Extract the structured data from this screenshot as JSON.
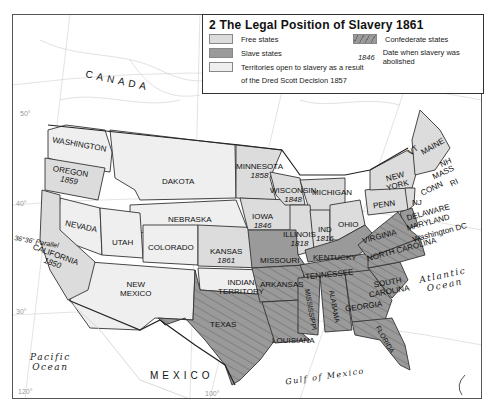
{
  "legend": {
    "title": "2 The Legal Position of Slavery 1861",
    "items": [
      {
        "label": "Free states",
        "color": "#dcdcdc"
      },
      {
        "label": "Slave states",
        "color": "#9a9a9a"
      },
      {
        "label": "Territories open to slavery as a result",
        "label2": "of the Dred Scott Decision 1857",
        "color": "#efefef"
      },
      {
        "label": "Confederate states",
        "pattern": "hatched",
        "color": "#9a9a9a"
      },
      {
        "label": "Date when slavery was abolished",
        "sample": "1846"
      }
    ]
  },
  "regions": {
    "canada": "CANADA",
    "mexico": "MEXICO",
    "pacific": [
      "Pacific",
      "Ocean"
    ],
    "atlantic": [
      "Atlantic",
      "Ocean"
    ],
    "gulf": "Gulf of Mexico",
    "parallel": "36°36' Parallel"
  },
  "states": [
    {
      "name": "WASHINGTON"
    },
    {
      "name": "OREGON",
      "year": "1859"
    },
    {
      "name": "CALIFORNIA",
      "year": "1850"
    },
    {
      "name": "NEVADA"
    },
    {
      "name": "UTAH"
    },
    {
      "name": "COLORADO"
    },
    {
      "name": "NEW",
      "name2": "MEXICO"
    },
    {
      "name": "DAKOTA"
    },
    {
      "name": "NEBRASKA"
    },
    {
      "name": "KANSAS",
      "year": "1861"
    },
    {
      "name": "INDIAN",
      "name2": "TERRITORY"
    },
    {
      "name": "TEXAS"
    },
    {
      "name": "MINNESOTA",
      "year": "1858"
    },
    {
      "name": "IOWA",
      "year": "1846"
    },
    {
      "name": "WISCONSIN",
      "year": "1848"
    },
    {
      "name": "MICHIGAN"
    },
    {
      "name": "ILLINOIS",
      "year": "1818"
    },
    {
      "name": "IND",
      "year": "1816"
    },
    {
      "name": "OHIO"
    },
    {
      "name": "MISSOURI"
    },
    {
      "name": "ARKANSAS"
    },
    {
      "name": "LOUISIANA"
    },
    {
      "name": "KENTUCKY"
    },
    {
      "name": "TENNESSEE"
    },
    {
      "name": "MISSISSIPPI"
    },
    {
      "name": "ALABAMA"
    },
    {
      "name": "GEORGIA"
    },
    {
      "name": "FLORIDA"
    },
    {
      "name": "SOUTH",
      "name2": "CAROLINA"
    },
    {
      "name": "NORTH CAROLINA"
    },
    {
      "name": "VIRGINIA"
    },
    {
      "name": "PENN"
    },
    {
      "name": "NEW",
      "name2": "YORK"
    },
    {
      "name": "NJ"
    },
    {
      "name": "DELAWARE"
    },
    {
      "name": "MARYLAND"
    },
    {
      "name": "Washington DC"
    },
    {
      "name": "VT"
    },
    {
      "name": "MAINE"
    },
    {
      "name": "NH"
    },
    {
      "name": "MASS"
    },
    {
      "name": "CONN"
    },
    {
      "name": "RI"
    }
  ],
  "gridlines": {
    "lat": [
      "50°",
      "40°",
      "30°"
    ],
    "lon": [
      "120°",
      "100°",
      "90°",
      "80°"
    ]
  },
  "colors": {
    "free": "#dcdcdc",
    "slave": "#9a9a9a",
    "territory": "#efefef",
    "ocean": "#ffffff",
    "border": "#333333"
  }
}
